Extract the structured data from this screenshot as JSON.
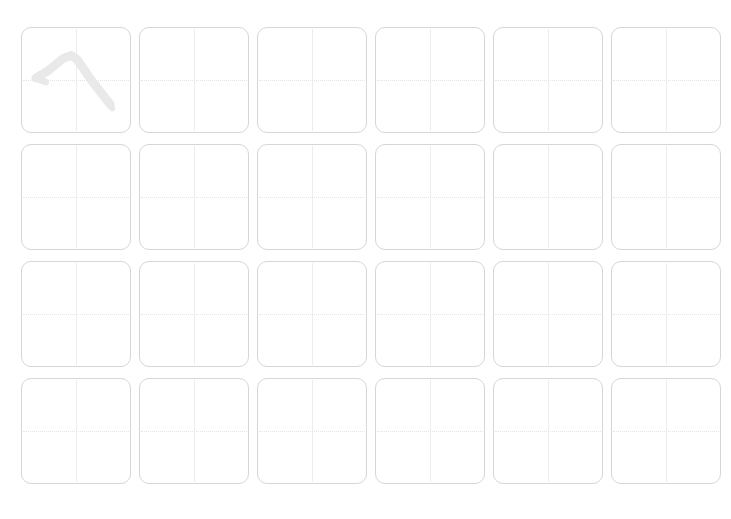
{
  "sheet": {
    "title": "Handwriting Practice Grid",
    "description": "Blank character practice sheet with one demonstration stroke",
    "background_color": "#ffffff",
    "columns": 6,
    "rows": 4,
    "total_cells": 24,
    "cell": {
      "width_px": 110,
      "height_px": 106,
      "corner_radius_px": 10,
      "border_color": "#d6d6d6",
      "fill_color": "#ffffff"
    },
    "guides": {
      "vertical_color": "#ededed",
      "vertical_style": "solid",
      "horizontal_color": "#e4e4e4",
      "horizontal_style": "dotted"
    },
    "stroke": {
      "color": "#e9e9e9",
      "cell_index": 0,
      "row": 1,
      "column": 1,
      "name": "peaked-descending-stroke"
    },
    "cells": [
      {
        "id": "cell-r1c1",
        "row": 1,
        "column": 1,
        "has_stroke": true,
        "content": ""
      },
      {
        "id": "cell-r1c2",
        "row": 1,
        "column": 2,
        "has_stroke": false,
        "content": ""
      },
      {
        "id": "cell-r1c3",
        "row": 1,
        "column": 3,
        "has_stroke": false,
        "content": ""
      },
      {
        "id": "cell-r1c4",
        "row": 1,
        "column": 4,
        "has_stroke": false,
        "content": ""
      },
      {
        "id": "cell-r1c5",
        "row": 1,
        "column": 5,
        "has_stroke": false,
        "content": ""
      },
      {
        "id": "cell-r1c6",
        "row": 1,
        "column": 6,
        "has_stroke": false,
        "content": ""
      },
      {
        "id": "cell-r2c1",
        "row": 2,
        "column": 1,
        "has_stroke": false,
        "content": ""
      },
      {
        "id": "cell-r2c2",
        "row": 2,
        "column": 2,
        "has_stroke": false,
        "content": ""
      },
      {
        "id": "cell-r2c3",
        "row": 2,
        "column": 3,
        "has_stroke": false,
        "content": ""
      },
      {
        "id": "cell-r2c4",
        "row": 2,
        "column": 4,
        "has_stroke": false,
        "content": ""
      },
      {
        "id": "cell-r2c5",
        "row": 2,
        "column": 5,
        "has_stroke": false,
        "content": ""
      },
      {
        "id": "cell-r2c6",
        "row": 2,
        "column": 6,
        "has_stroke": false,
        "content": ""
      },
      {
        "id": "cell-r3c1",
        "row": 3,
        "column": 1,
        "has_stroke": false,
        "content": ""
      },
      {
        "id": "cell-r3c2",
        "row": 3,
        "column": 2,
        "has_stroke": false,
        "content": ""
      },
      {
        "id": "cell-r3c3",
        "row": 3,
        "column": 3,
        "has_stroke": false,
        "content": ""
      },
      {
        "id": "cell-r3c4",
        "row": 3,
        "column": 4,
        "has_stroke": false,
        "content": ""
      },
      {
        "id": "cell-r3c5",
        "row": 3,
        "column": 5,
        "has_stroke": false,
        "content": ""
      },
      {
        "id": "cell-r3c6",
        "row": 3,
        "column": 6,
        "has_stroke": false,
        "content": ""
      },
      {
        "id": "cell-r4c1",
        "row": 4,
        "column": 1,
        "has_stroke": false,
        "content": ""
      },
      {
        "id": "cell-r4c2",
        "row": 4,
        "column": 2,
        "has_stroke": false,
        "content": ""
      },
      {
        "id": "cell-r4c3",
        "row": 4,
        "column": 3,
        "has_stroke": false,
        "content": ""
      },
      {
        "id": "cell-r4c4",
        "row": 4,
        "column": 4,
        "has_stroke": false,
        "content": ""
      },
      {
        "id": "cell-r4c5",
        "row": 4,
        "column": 5,
        "has_stroke": false,
        "content": ""
      },
      {
        "id": "cell-r4c6",
        "row": 4,
        "column": 6,
        "has_stroke": false,
        "content": ""
      }
    ]
  }
}
